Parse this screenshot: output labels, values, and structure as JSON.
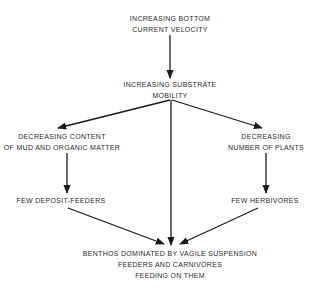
{
  "diagram": {
    "type": "flowchart",
    "nodes": [
      {
        "id": "n1",
        "lines": [
          "INCREASING BOTTOM",
          "CURRENT VELOCITY"
        ]
      },
      {
        "id": "n2",
        "lines": [
          "INCREASING SUBSTRATE",
          "MOBILITY"
        ]
      },
      {
        "id": "n3",
        "lines": [
          "DECREASING CONTENT",
          "OF MUD AND ORGANIC MATTER"
        ]
      },
      {
        "id": "n4",
        "lines": [
          "DECREASING",
          "NUMBER OF PLANTS"
        ]
      },
      {
        "id": "n5",
        "lines": [
          "FEW DEPOSIT-FEEDERS"
        ]
      },
      {
        "id": "n6",
        "lines": [
          "FEW HERBIVORES"
        ]
      },
      {
        "id": "n7",
        "lines": [
          "BENTHOS DOMINATED BY VAGILE SUSPENSION",
          "FEEDERS AND CARNIVORES",
          "FEEDING ON THEM"
        ]
      }
    ],
    "edges": [
      {
        "from": "n1",
        "to": "n2"
      },
      {
        "from": "n2",
        "to": "n3"
      },
      {
        "from": "n2",
        "to": "n4"
      },
      {
        "from": "n2",
        "to": "n7"
      },
      {
        "from": "n3",
        "to": "n5"
      },
      {
        "from": "n4",
        "to": "n6"
      },
      {
        "from": "n5",
        "to": "n7"
      },
      {
        "from": "n6",
        "to": "n7"
      }
    ],
    "colors": {
      "line": "#1a1a1a",
      "text": "#2a2a2a",
      "background": "#ffffff"
    }
  }
}
